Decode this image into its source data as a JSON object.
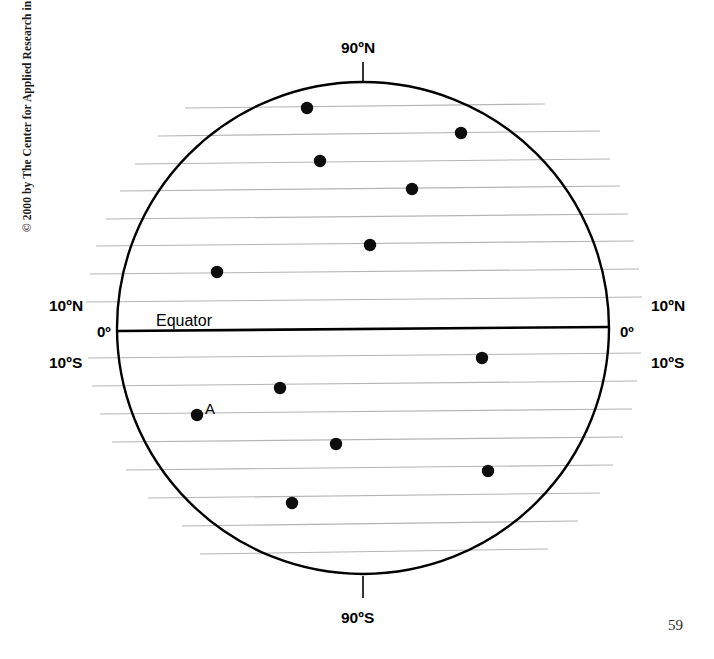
{
  "page": {
    "copyright": "© 2000 by The Center for Applied Research in Education",
    "page_number": "59"
  },
  "labels": {
    "north_pole": "90ºN",
    "south_pole": "90ºS",
    "equator": "Equator",
    "lat_10n_left": "10ºN",
    "lat_0_left": "0º",
    "lat_10s_left": "10ºS",
    "lat_10n_right": "10ºN",
    "lat_0_right": "0º",
    "lat_10s_right": "10ºS",
    "point_a": "A"
  },
  "colors": {
    "ink": "#000000",
    "gridline": "#b4b4b4",
    "background": "#ffffff",
    "dot": "#0d0d0d"
  },
  "chart_data": {
    "type": "scatter",
    "title": "",
    "subtitle": "",
    "xlabel": "",
    "ylabel": "",
    "projection": "globe-circle-with-latitude-lines",
    "grid": true,
    "legend_position": "none",
    "circle": {
      "cx": 363,
      "cy": 328,
      "r": 246
    },
    "equator": {
      "label": "Equator",
      "y_left": 331,
      "y_right": 327,
      "x_left": 118,
      "x_right": 609,
      "stroke_width": 2.6
    },
    "pole_ticks": [
      {
        "name": "north",
        "x": 363,
        "y_from": 62,
        "y_to": 82,
        "label": "90ºN"
      },
      {
        "name": "south",
        "x": 363,
        "y_from": 576,
        "y_to": 598,
        "label": "90ºS"
      }
    ],
    "latitude_lines": [
      {
        "index": 1,
        "x1": 185,
        "y1": 108,
        "x2": 545,
        "y2": 104
      },
      {
        "index": 2,
        "x1": 158,
        "y1": 136,
        "x2": 600,
        "y2": 131
      },
      {
        "index": 3,
        "x1": 135,
        "y1": 164,
        "x2": 610,
        "y2": 159
      },
      {
        "index": 4,
        "x1": 120,
        "y1": 191,
        "x2": 620,
        "y2": 186
      },
      {
        "index": 5,
        "x1": 106,
        "y1": 219,
        "x2": 628,
        "y2": 214
      },
      {
        "index": 6,
        "x1": 96,
        "y1": 246,
        "x2": 634,
        "y2": 241
      },
      {
        "index": 7,
        "x1": 90,
        "y1": 274,
        "x2": 639,
        "y2": 269
      },
      {
        "index": 8,
        "x1": 86,
        "y1": 302,
        "x2": 642,
        "y2": 297
      },
      {
        "index": 9,
        "x1": 88,
        "y1": 358,
        "x2": 641,
        "y2": 353
      },
      {
        "index": 10,
        "x1": 92,
        "y1": 386,
        "x2": 637,
        "y2": 381
      },
      {
        "index": 11,
        "x1": 100,
        "y1": 414,
        "x2": 632,
        "y2": 409
      },
      {
        "index": 12,
        "x1": 112,
        "y1": 442,
        "x2": 623,
        "y2": 437
      },
      {
        "index": 13,
        "x1": 126,
        "y1": 470,
        "x2": 613,
        "y2": 465
      },
      {
        "index": 14,
        "x1": 148,
        "y1": 498,
        "x2": 600,
        "y2": 493
      },
      {
        "index": 15,
        "x1": 182,
        "y1": 526,
        "x2": 578,
        "y2": 521
      },
      {
        "index": 16,
        "x1": 200,
        "y1": 554,
        "x2": 548,
        "y2": 549
      }
    ],
    "points": [
      {
        "id": "p1",
        "label": "",
        "x": 307,
        "y": 108,
        "hemisphere": "north"
      },
      {
        "id": "p2",
        "label": "",
        "x": 461,
        "y": 133,
        "hemisphere": "north"
      },
      {
        "id": "p3",
        "label": "",
        "x": 320,
        "y": 161,
        "hemisphere": "north"
      },
      {
        "id": "p4",
        "label": "",
        "x": 412,
        "y": 189,
        "hemisphere": "north"
      },
      {
        "id": "p5",
        "label": "",
        "x": 370,
        "y": 245,
        "hemisphere": "north"
      },
      {
        "id": "p6",
        "label": "",
        "x": 217,
        "y": 272,
        "hemisphere": "north"
      },
      {
        "id": "p7",
        "label": "",
        "x": 482,
        "y": 358,
        "hemisphere": "south"
      },
      {
        "id": "p8",
        "label": "",
        "x": 280,
        "y": 388,
        "hemisphere": "south"
      },
      {
        "id": "p9",
        "label": "A",
        "x": 197,
        "y": 415,
        "hemisphere": "south"
      },
      {
        "id": "p10",
        "label": "",
        "x": 336,
        "y": 444,
        "hemisphere": "south"
      },
      {
        "id": "p11",
        "label": "",
        "x": 488,
        "y": 471,
        "hemisphere": "south"
      },
      {
        "id": "p12",
        "label": "",
        "x": 292,
        "y": 503,
        "hemisphere": "south"
      }
    ],
    "point_radius": 6.2
  }
}
